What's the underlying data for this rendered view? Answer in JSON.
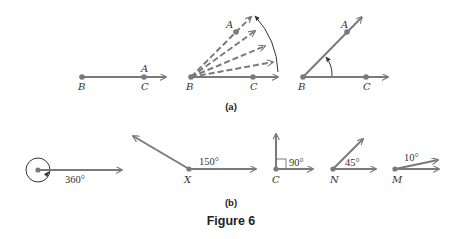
{
  "colors": {
    "ray": "#7a7a7a",
    "arc": "#333333",
    "text": "#333333",
    "background": "#ffffff"
  },
  "figure": {
    "title": "Figure 6",
    "part_a": {
      "caption": "(a)",
      "panels": [
        {
          "description": "Initial side BA coincides with BC",
          "labels": {
            "vertex": "B",
            "point_c": "C",
            "point_a": "A"
          }
        },
        {
          "description": "Ray BA rotates counterclockwise (dashed positions)",
          "labels": {
            "vertex": "B",
            "point_c": "C",
            "point_a": "A"
          }
        },
        {
          "description": "Angle ABC formed after rotation",
          "labels": {
            "vertex": "B",
            "point_c": "C",
            "point_a": "A"
          }
        }
      ]
    },
    "part_b": {
      "caption": "(b)",
      "angles": [
        {
          "vertex": "",
          "measure": "360°"
        },
        {
          "vertex": "X",
          "measure": "150°"
        },
        {
          "vertex": "C",
          "measure": "90°"
        },
        {
          "vertex": "N",
          "measure": "45°"
        },
        {
          "vertex": "M",
          "measure": "10°"
        }
      ]
    }
  }
}
